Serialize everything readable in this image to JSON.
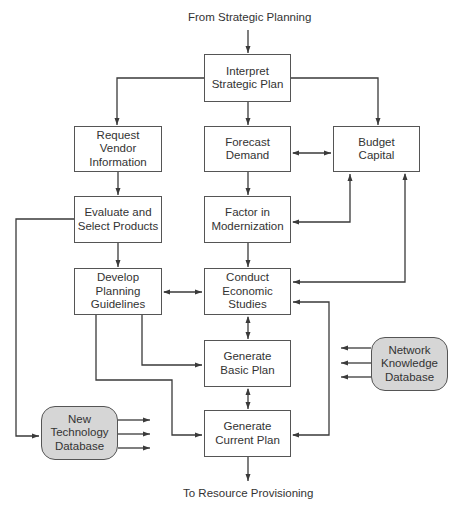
{
  "diagram": {
    "input_label": "From Strategic Planning",
    "output_label": "To Resource Provisioning",
    "nodes": {
      "interpret": "Interpret\nStrategic Plan",
      "request_vendor": "Request\nVendor\nInformation",
      "forecast": "Forecast\nDemand",
      "budget": "Budget\nCapital",
      "evaluate": "Evaluate and\nSelect Products",
      "factor": "Factor in\nModernization",
      "develop": "Develop\nPlanning\nGuidelines",
      "conduct": "Conduct\nEconomic\nStudies",
      "basic_plan": "Generate\nBasic Plan",
      "current_plan": "Generate\nCurrent Plan",
      "new_tech_db": "New\nTechnology\nDatabase",
      "network_db": "Network\nKnowledge\nDatabase"
    },
    "colors": {
      "line": "#3a3a3a",
      "box_border": "#555555",
      "database_fill": "#d6d6d6",
      "text": "#333333"
    }
  }
}
